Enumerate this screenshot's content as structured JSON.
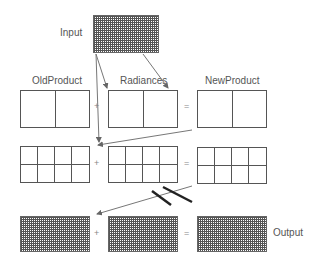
{
  "diagram": {
    "labels": {
      "input": "Input",
      "old_product": "OldProduct",
      "radiances": "Radiances",
      "new_product": "NewProduct",
      "output": "Output"
    },
    "operators": {
      "plus": "+",
      "equals": "="
    },
    "rows": [
      {
        "name": "row-1",
        "grid": "1x2",
        "left": "OldProduct",
        "middle": "Radiances",
        "right": "NewProduct"
      },
      {
        "name": "row-2",
        "grid": "2x4"
      },
      {
        "name": "row-3",
        "grid": "dense",
        "right_label": "Output"
      }
    ],
    "colors": {
      "line": "#555555",
      "arrow": "#777777",
      "text": "#555555"
    }
  }
}
